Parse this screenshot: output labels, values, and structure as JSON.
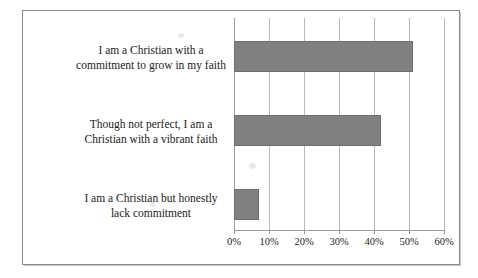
{
  "chart_data": {
    "type": "bar",
    "orientation": "horizontal",
    "title": "",
    "xlabel": "",
    "ylabel": "",
    "categories": [
      "I am a Christian with a commitment to grow in my faith",
      "Though not perfect, I am a Christian with a vibrant faith",
      "I am a Christian but honestly lack commitment"
    ],
    "category_lines": [
      [
        "I am a Christian with a",
        "commitment to grow in my faith"
      ],
      [
        "Though not perfect, I am a",
        "Christian with a vibrant faith"
      ],
      [
        "I am a Christian but honestly",
        "lack commitment"
      ]
    ],
    "values": [
      51,
      42,
      7
    ],
    "value_labels": [
      "51%",
      "42%",
      "7%"
    ],
    "xlim": [
      0,
      60
    ],
    "xticks": [
      0,
      10,
      20,
      30,
      40,
      50,
      60
    ],
    "xtick_labels": [
      "0%",
      "10%",
      "20%",
      "30%",
      "40%",
      "50%",
      "60%"
    ],
    "grid": true,
    "grid_axis": "x",
    "legend": false,
    "bar_color": "#808080",
    "bar_edge_color": "#6f6f6f",
    "gridline_color": "#b9b9b9",
    "frame_color": "#8c8c8c",
    "text_color": "#1b1b1b"
  }
}
